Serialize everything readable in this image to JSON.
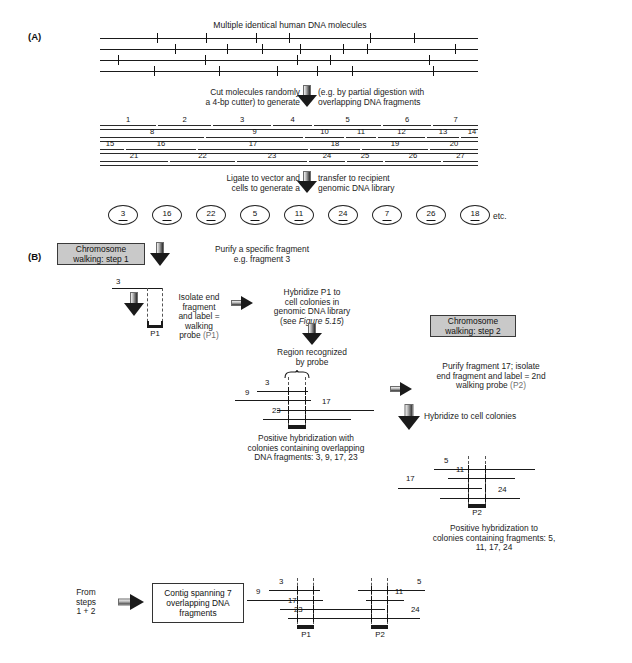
{
  "figure": {
    "panel_a": {
      "label": "(A)",
      "title": "Multiple identical human DNA molecules",
      "step_caption_left": "Cut molecules randomly\na 4-bp cutter) to generate",
      "step_caption_right": "(e.g. by partial digestion with\noverlapping DNA fragments",
      "fragment_rows": [
        {
          "numbers": [
            "1",
            "2",
            "3",
            "4",
            "5",
            "6",
            "7"
          ]
        },
        {
          "numbers": [
            "8",
            "9",
            "10",
            "11",
            "12",
            "13",
            "14"
          ]
        },
        {
          "numbers": [
            "15",
            "16",
            "17",
            "18",
            "19",
            "20"
          ]
        },
        {
          "numbers": [
            "21",
            "22",
            "23",
            "24",
            "25",
            "26",
            "27"
          ]
        }
      ],
      "library_caption_left": "Ligate to vector and\ncells to generate a",
      "library_caption_right": "transfer to recipient\ngenomic DNA library",
      "colonies": [
        "3",
        "16",
        "22",
        "5",
        "11",
        "24",
        "7",
        "26",
        "18"
      ],
      "colonies_etc": "etc."
    },
    "panel_b": {
      "label": "(B)",
      "step1_box": "Chromosome\nwalking: step 1",
      "step1_caption": "Purify a specific fragment\ne.g. fragment 3",
      "fragment3_label": "3",
      "isolate_caption": "Isolate end\nfragment\nand label =\nwalking\nprobe",
      "isolate_probe": "(P1)",
      "probe1_label": "P1",
      "hybridize_p1_caption": "Hybridize P1 to\ncell colonies in\ngenomic DNA library",
      "hybridize_p1_ref_prefix": "(see ",
      "hybridize_p1_ref_italic": "Figure 5.15",
      "hybridize_p1_ref_suffix": ")",
      "region_caption": "Region recognized\nby probe",
      "cluster1_fragments": [
        "3",
        "9",
        "17",
        "23"
      ],
      "cluster1_caption": "Positive hybridization with\ncolonies containing overlapping\nDNA fragments: 3, 9, 17, 23",
      "step2_box": "Chromosome\nwalking: step 2",
      "step2_caption": "Purify fragment 17; isolate\nend fragment and label = 2nd\nwalking probe",
      "step2_probe": "(P2)",
      "hybridize_colonies_caption": "Hybridize to cell colonies",
      "cluster2_fragments": [
        "5",
        "11",
        "17",
        "24"
      ],
      "probe2_label": "P2",
      "cluster2_caption": "Positive hybridization to\ncolonies containing fragments: 5,\n11, 17, 24",
      "from_steps_caption": "From\nsteps\n1 + 2",
      "contig_box": "Contig spanning 7\noverlapping DNA\nfragments",
      "contig_fragments": [
        "3",
        "9",
        "17",
        "23",
        "5",
        "11",
        "24"
      ],
      "contig_probe1": "P1",
      "contig_probe2": "P2"
    }
  },
  "colors": {
    "line": "#1a1a1a",
    "box_fill": "#c9c9c9",
    "box_border": "#3a3a3a",
    "grey_text": "#6e6e6e"
  }
}
